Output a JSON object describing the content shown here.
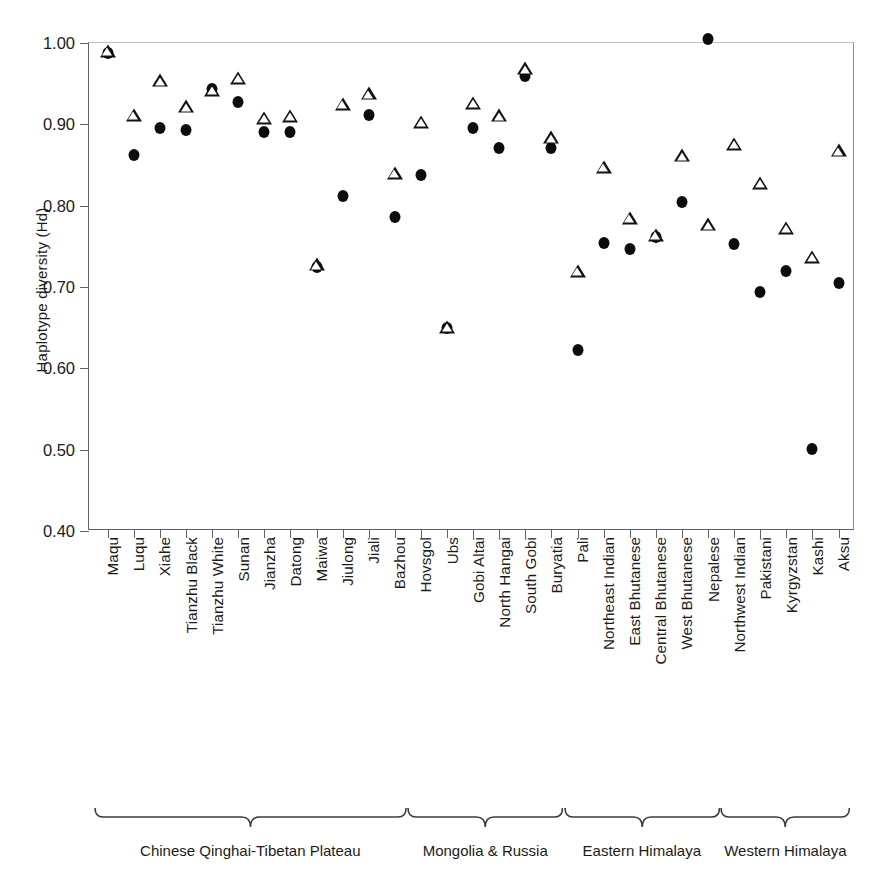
{
  "chart_data": {
    "type": "scatter",
    "title": "",
    "xlabel": "",
    "ylabel": "Haplotype diversity (Hd)",
    "ylim": [
      0.4,
      1.0
    ],
    "yticks": [
      "0.40",
      "0.50",
      "0.60",
      "0.70",
      "0.80",
      "0.90",
      "1.00"
    ],
    "ytick_values": [
      0.4,
      0.5,
      0.6,
      0.7,
      0.8,
      0.9,
      1.0
    ],
    "grid": false,
    "legend_position": "none",
    "categories": [
      "Maqu",
      "Luqu",
      "Xiahe",
      "Tianzhu Black",
      "Tianzhu White",
      "Sunan",
      "Jianzha",
      "Datong",
      "Maiwa",
      "Jiulong",
      "Jiali",
      "Bazhou",
      "Hovsgol",
      "Ubs",
      "Gobi Altai",
      "North Hangai",
      "South Gobi",
      "Buryatia",
      "Pali",
      "Northeast Indian",
      "East Bhutanese",
      "Central Bhutanese",
      "West Bhutanese",
      "Nepalese",
      "Northwest Indian",
      "Pakistani",
      "Kyrgyzstan",
      "Kashi",
      "Aksu"
    ],
    "series": [
      {
        "name": "filled-circle",
        "marker": "circle",
        "values": [
          0.988,
          0.862,
          0.895,
          0.893,
          0.944,
          0.928,
          0.891,
          0.89,
          0.725,
          0.812,
          0.911,
          0.786,
          0.838,
          0.649,
          0.895,
          0.871,
          0.96,
          0.871,
          0.622,
          0.754,
          0.747,
          0.762,
          0.804,
          1.005,
          0.753,
          0.694,
          0.72,
          0.501,
          0.705
        ]
      },
      {
        "name": "open-triangle",
        "marker": "triangle",
        "values": [
          0.99,
          0.912,
          0.954,
          0.922,
          0.942,
          0.957,
          0.908,
          0.91,
          0.728,
          0.925,
          0.938,
          0.84,
          0.903,
          0.651,
          0.926,
          0.911,
          0.969,
          0.884,
          0.72,
          0.848,
          0.785,
          0.764,
          0.862,
          0.777,
          0.876,
          0.828,
          0.773,
          0.737,
          0.868
        ]
      }
    ],
    "groups": [
      {
        "label": "Chinese Qinghai-Tibetan Plateau",
        "start_index": 0,
        "end_index": 11
      },
      {
        "label": "Mongolia  & Russia",
        "start_index": 12,
        "end_index": 17
      },
      {
        "label": "Eastern Himalaya",
        "start_index": 18,
        "end_index": 23
      },
      {
        "label": "Western Himalaya",
        "start_index": 24,
        "end_index": 28
      }
    ],
    "colors": {
      "marker_fill": "#0c0c0c",
      "marker_outline": "#111111",
      "axis": "#5f6164",
      "text": "#1b1b1b",
      "background": "#ffffff"
    }
  }
}
